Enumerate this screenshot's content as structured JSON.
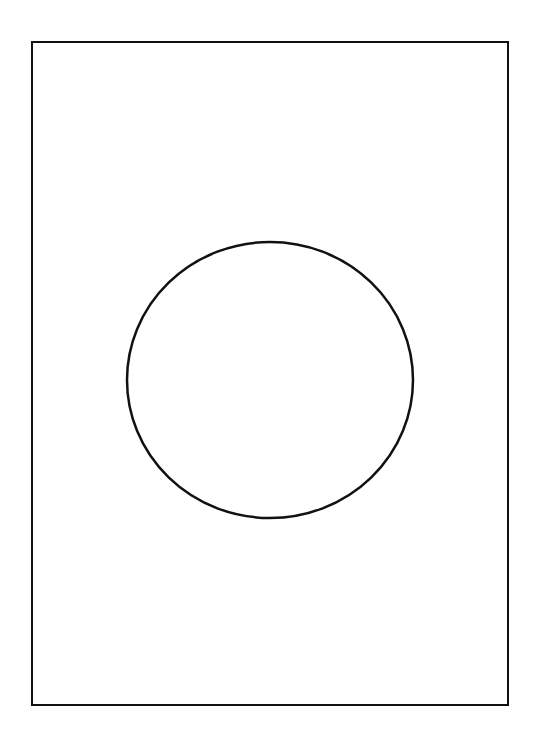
{
  "diagram": {
    "frame": {
      "x": 31,
      "y": 41,
      "width": 478,
      "height": 665,
      "stroke": "#111111",
      "stroke_width": 2
    },
    "circle": {
      "cx": 270,
      "cy": 380,
      "rx": 143,
      "ry": 138,
      "stroke": "#111111",
      "stroke_width": 2.5,
      "fill": "none"
    }
  }
}
